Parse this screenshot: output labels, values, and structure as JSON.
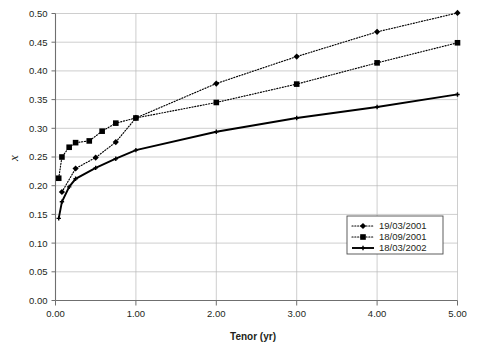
{
  "chart_data": {
    "type": "line",
    "title": "",
    "xlabel": "Tenor (yr)",
    "ylabel": "x",
    "xlim": [
      0.0,
      5.0
    ],
    "ylim": [
      0.0,
      0.5
    ],
    "xticks": [
      "0.00",
      "1.00",
      "2.00",
      "3.00",
      "4.00",
      "5.00"
    ],
    "xtick_values": [
      0.0,
      1.0,
      2.0,
      3.0,
      4.0,
      5.0
    ],
    "yticks": [
      "0.00",
      "0.05",
      "0.10",
      "0.15",
      "0.20",
      "0.25",
      "0.30",
      "0.35",
      "0.40",
      "0.45",
      "0.50"
    ],
    "ytick_values": [
      0.0,
      0.05,
      0.1,
      0.15,
      0.2,
      0.25,
      0.3,
      0.35,
      0.4,
      0.45,
      0.5
    ],
    "grid": true,
    "legend_position": "lower-right",
    "series": [
      {
        "name": "19/03/2001",
        "marker": "diamond",
        "linestyle": "dotted",
        "color": "#000000",
        "x": [
          0.08,
          0.25,
          0.5,
          0.75,
          1.0,
          2.0,
          3.0,
          4.0,
          5.0
        ],
        "y": [
          0.189,
          0.23,
          0.249,
          0.276,
          0.318,
          0.378,
          0.425,
          0.468,
          0.501
        ]
      },
      {
        "name": "18/09/2001",
        "marker": "square",
        "linestyle": "dotted",
        "color": "#000000",
        "x": [
          0.04,
          0.08,
          0.17,
          0.25,
          0.42,
          0.58,
          0.75,
          1.0,
          2.0,
          3.0,
          4.0,
          5.0
        ],
        "y": [
          0.213,
          0.25,
          0.267,
          0.275,
          0.278,
          0.295,
          0.309,
          0.318,
          0.345,
          0.377,
          0.414,
          0.449
        ]
      },
      {
        "name": "18/03/2002",
        "marker": "cross",
        "linestyle": "solid",
        "color": "#000000",
        "x": [
          0.04,
          0.08,
          0.17,
          0.25,
          0.5,
          0.75,
          1.0,
          2.0,
          3.0,
          4.0,
          5.0
        ],
        "y": [
          0.143,
          0.172,
          0.198,
          0.212,
          0.231,
          0.247,
          0.262,
          0.294,
          0.318,
          0.337,
          0.359
        ]
      }
    ]
  },
  "legend": {
    "entries": [
      {
        "label": "19/03/2001",
        "marker": "diamond-icon",
        "style": "dotted"
      },
      {
        "label": "18/09/2001",
        "marker": "square-icon",
        "style": "dotted"
      },
      {
        "label": "18/03/2002",
        "marker": "cross-icon",
        "style": "solid"
      }
    ]
  }
}
